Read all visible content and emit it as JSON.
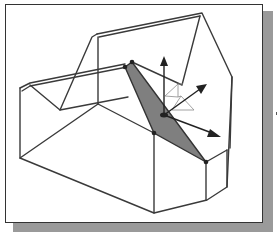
{
  "figure": {
    "colors": {
      "background": "#ffffff",
      "frame_border": "#333333",
      "drop_shadow": "#9a9a9a",
      "wireframe_edge": "#3a3a3a",
      "selected_face": "#7f7f7f",
      "gizmo": "#222222",
      "gizmo_plane": "#8c8c8c"
    },
    "elements": {
      "selected_face": "highlighted face",
      "gizmo_axes": [
        "up-arrow",
        "depth-arrow",
        "right-arrow"
      ],
      "gizmo_plane_handles": 2
    }
  }
}
